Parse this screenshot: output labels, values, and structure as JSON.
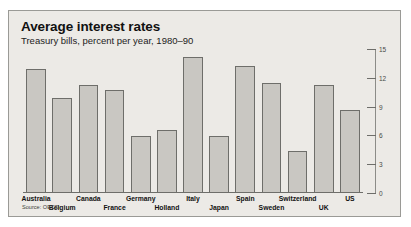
{
  "figure": {
    "title": "Average interest rates",
    "subtitle": "Treasury bills, percent per year, 1980–90",
    "source": "Source: OECD",
    "panel_bg": "#eceae6",
    "panel_border": "#9a9a96",
    "bar_fill": "#c9c7c2",
    "bar_border": "#6e6e6a"
  },
  "chart_data": {
    "type": "bar",
    "title": "Average interest rates",
    "subtitle": "Treasury bills, percent per year, 1980–90",
    "xlabel": "",
    "ylabel": "",
    "ylim": [
      0,
      15
    ],
    "yticks": [
      0,
      3,
      6,
      9,
      12,
      15
    ],
    "ytick_labels": [
      "0",
      "3",
      "6",
      "9",
      "12",
      "15"
    ],
    "y_axis_position": "right",
    "grid": false,
    "legend": "none",
    "source": "Source: OECD",
    "categories": [
      "Australia",
      "Belgium",
      "Canada",
      "France",
      "Germany",
      "Holland",
      "Italy",
      "Japan",
      "Spain",
      "Sweden",
      "Switzerland",
      "UK",
      "US"
    ],
    "values": [
      12.9,
      9.9,
      11.2,
      10.7,
      5.9,
      6.6,
      14.2,
      5.9,
      13.2,
      11.5,
      4.4,
      11.2,
      8.6
    ],
    "label_rows": [
      "top",
      "bottom",
      "top",
      "bottom",
      "top",
      "bottom",
      "top",
      "bottom",
      "top",
      "bottom",
      "top",
      "bottom",
      "top"
    ]
  }
}
